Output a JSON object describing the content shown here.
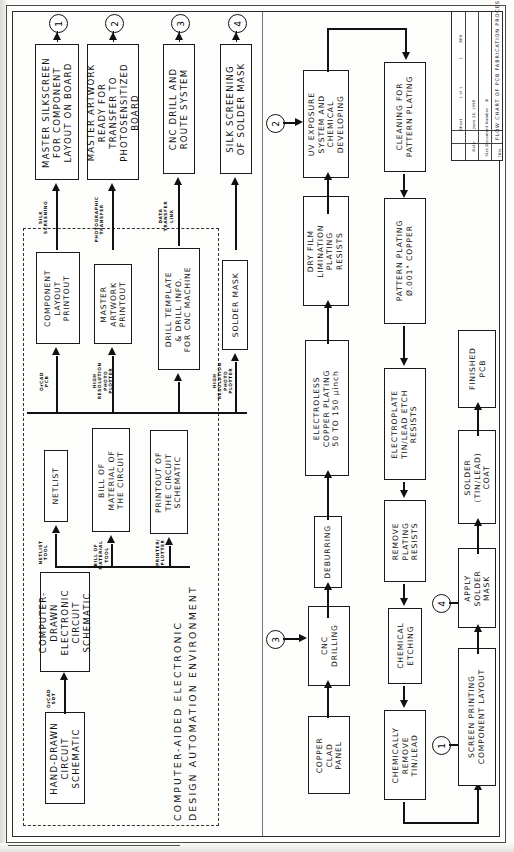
{
  "drawing": {
    "sheet_title": "FLOW CHART OF PCB FABRICATION PROCESS",
    "title_label": "Title",
    "doc_label": "Size Document Number",
    "doc_size": "B",
    "rev_label": "REV",
    "rev_value": "1",
    "date_label": "Date:",
    "date_value": "June 24, 1998",
    "sheet_label": "Sheet",
    "sheet_value": "1 of 1"
  },
  "cad_region": {
    "caption_line1": "COMPUTER-AIDED ELECTRONIC",
    "caption_line2": "DESIGN AUTOMATION ENVIRONMENT"
  },
  "outputs": [
    {
      "id": "out1",
      "ref": "1",
      "text": "MASTER SILKSCREEN\nFOR COMPONENT\nLAYOUT ON BOARD"
    },
    {
      "id": "out2",
      "ref": "2",
      "text": "MASTER ARTWORK\nREADY FOR\nTRANSFER TO\nPHOTOSENSITIZED\nBOARD"
    },
    {
      "id": "out3",
      "ref": "3",
      "text": "CNC DRILL AND\nROUTE SYSTEM"
    },
    {
      "id": "out4",
      "ref": "4",
      "text": "SILK SCREENING\nOF SOLDER MASK"
    }
  ],
  "printouts": [
    {
      "id": "p1",
      "text": "COMPONENT\nLAYOUT\nPRINTOUT"
    },
    {
      "id": "p2",
      "text": "MASTER\nARTWORK\nPRINTOUT"
    },
    {
      "id": "p3",
      "text": "DRILL TEMPLATE\n& DRILL INFO.\nFOR CNC MACHINE"
    },
    {
      "id": "p4",
      "text": "SOLDER MASK"
    }
  ],
  "design_outputs": [
    {
      "id": "d1",
      "text": "NETLIST"
    },
    {
      "id": "d2",
      "text": "BILL OF\nMATERIAL OF\nTHE CIRCUIT"
    },
    {
      "id": "d3",
      "text": "PRINTOUT OF\nTHE CIRCUIT\nSCHEMATIC"
    }
  ],
  "sources": [
    {
      "id": "s1",
      "text": "HAND-DRAWN\nCIRCUIT\nSCHEMATIC"
    },
    {
      "id": "s2",
      "text": "COMPUTER-\nDRAWN\nELECTRONIC\nCIRCUIT\nSCHEMATIC"
    }
  ],
  "process": [
    {
      "id": "f1",
      "text": "COPPER\nCLAD\nPANEL"
    },
    {
      "id": "f2",
      "text": "CNC\nDRILLING"
    },
    {
      "id": "f3",
      "text": "DEBURRING"
    },
    {
      "id": "f4",
      "text": "ELECTROLESS\nCOPPER PLATING\n50 TO 150 μinch"
    },
    {
      "id": "f5",
      "text": "DRY FILM\nLIMINATION\nPLATING\nRESISTS"
    },
    {
      "id": "f6",
      "text": "UV EXPOSURE\nSYSTEM AND\nCHEMICAL\nDEVELOPING"
    },
    {
      "id": "f7",
      "text": "CLEANING FOR\nPATTERN PLATING"
    },
    {
      "id": "f8",
      "text": "PATTERN PLATING\nØ.001\" COPPER"
    },
    {
      "id": "f9",
      "text": "ELECTROPLATE\nTIN/LEAD ETCH\nRESISTS"
    },
    {
      "id": "f10",
      "text": "REMOVE\nPLATING\nRESISTS"
    },
    {
      "id": "f11",
      "text": "CHEMICAL\nETCHING"
    },
    {
      "id": "f12",
      "text": "CHEMICALLY\nREMOVE\nTIN/LEAD"
    },
    {
      "id": "f13",
      "text": "SCREEN PRINTING\nCOMPONENT LAYOUT"
    },
    {
      "id": "f14",
      "text": "APPLY\nSOLDER\nMASK"
    },
    {
      "id": "f15",
      "text": "SOLDER\n(TIN/LEAD)\nCOAT"
    },
    {
      "id": "f16",
      "text": "FINISHED\nPCB"
    }
  ],
  "edge_labels": [
    {
      "id": "e1",
      "text": "SILK\nSCREENING"
    },
    {
      "id": "e2",
      "text": "PHOTOGRAPHIC\nTRANSFER"
    },
    {
      "id": "e3",
      "text": "DATA\nTRANSFER\nLINK"
    },
    {
      "id": "e4",
      "text": "OrCAD\nPCB"
    },
    {
      "id": "e5",
      "text": "HIGH\nRESOLUTION\nPHOTO\nPLOTTER"
    },
    {
      "id": "e6",
      "text": "HIGH\nRESOLUTION\nPHOTO\nPLOTTER"
    },
    {
      "id": "e7",
      "text": "NETLIST\nTOOL"
    },
    {
      "id": "e8",
      "text": "BILL OF\nMATERIAL\nTOOL"
    },
    {
      "id": "e9",
      "text": "PRINTER/\nPLOTTER"
    },
    {
      "id": "e10",
      "text": "OrCAD\nSDT"
    }
  ],
  "connector_refs": [
    {
      "id": "c1",
      "label": "1"
    },
    {
      "id": "c2",
      "label": "2"
    },
    {
      "id": "c3",
      "label": "3"
    },
    {
      "id": "c4",
      "label": "4"
    }
  ]
}
